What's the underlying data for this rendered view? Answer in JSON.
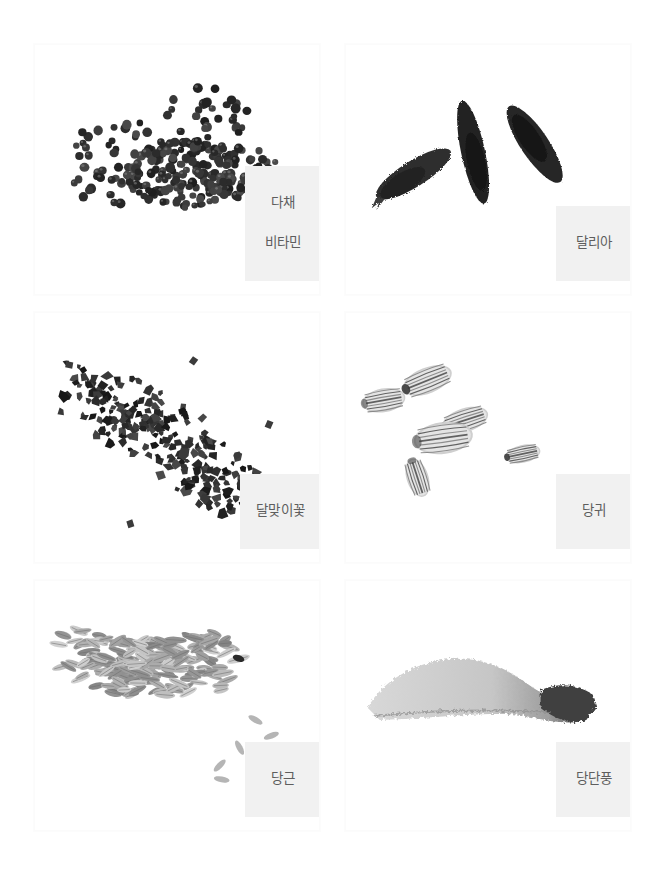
{
  "page": {
    "background_color": "#ffffff",
    "layout": "image-grid",
    "columns": 2,
    "rows": 3,
    "total_items": 6
  },
  "label_style": {
    "background_color": "#f1f1f1",
    "text_color": "#5e5e5e"
  },
  "gallery": {
    "items": [
      {
        "id": "item-1",
        "label_lines": [
          "다채",
          "비타민"
        ],
        "label_text": "다채 비타민",
        "image_name": "seed-photo-dachae-vitamin",
        "image_description": "scattered small round dark seeds",
        "seed_shape": "round",
        "seed_tone": "#3a3a3a"
      },
      {
        "id": "item-2",
        "label_lines": [
          "달리아"
        ],
        "label_text": "달리아",
        "image_name": "seed-photo-dahlia",
        "image_description": "three elongated dark seeds arranged in a V shape",
        "seed_shape": "elongated-pod",
        "seed_tone": "#2b2b2b"
      },
      {
        "id": "item-3",
        "label_lines": [
          "달맞이꽃"
        ],
        "label_text": "달맞이꽃",
        "image_name": "seed-photo-evening-primrose",
        "image_description": "dense diagonal band of angular dark seed fragments",
        "seed_shape": "angular-fragment",
        "seed_tone": "#333333"
      },
      {
        "id": "item-4",
        "label_lines": [
          "당귀"
        ],
        "label_text": "당귀",
        "image_name": "seed-photo-angelica",
        "image_description": "six ribbed oval pale seeds spread apart",
        "seed_shape": "ribbed-oval",
        "seed_tone": "#9a9a9a"
      },
      {
        "id": "item-5",
        "label_lines": [
          "당근"
        ],
        "label_text": "당근",
        "image_name": "seed-photo-carrot",
        "image_description": "pile of slender pale oblong seeds",
        "seed_shape": "slender-oblong",
        "seed_tone": "#a8a8a8"
      },
      {
        "id": "item-6",
        "label_lines": [
          "당단풍"
        ],
        "label_text": "당단풍",
        "image_name": "seed-photo-korean-maple",
        "image_description": "single winged maple samara with dark seed body at right",
        "seed_shape": "winged-samara",
        "seed_tone": "#c0c0c0"
      }
    ]
  }
}
